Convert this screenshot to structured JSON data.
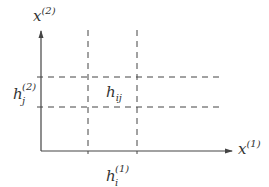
{
  "diagram": {
    "type": "grid-cell-on-axes",
    "colors": {
      "line": "#444444",
      "text": "#333333",
      "background": "#ffffff"
    },
    "axes": {
      "x": {
        "label_base": "x",
        "label_sup": "(1)"
      },
      "y": {
        "label_base": "x",
        "label_sup": "(2)"
      }
    },
    "labels": {
      "cell": {
        "base": "h",
        "sub": "ij"
      },
      "width": {
        "base": "h",
        "sup": "(1)",
        "sub": "i"
      },
      "height": {
        "base": "h",
        "sup": "(2)",
        "sub": "j"
      }
    },
    "grid": {
      "vertical_dashed_lines": 2,
      "horizontal_dashed_lines": 2
    }
  }
}
